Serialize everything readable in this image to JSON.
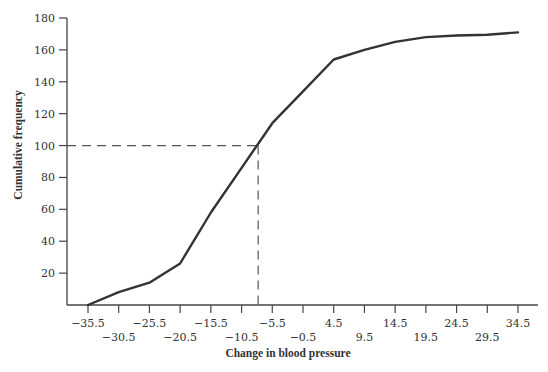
{
  "colors": {
    "background": "#ffffff",
    "axis": "#444444",
    "curve": "#333333",
    "dashed": "#555555",
    "text": "#333333"
  },
  "chart_data": {
    "type": "line",
    "title": "",
    "xlabel": "Change in blood pressure",
    "ylabel": "Cumulative frequency",
    "x": [
      -35.5,
      -30.5,
      -25.5,
      -20.5,
      -15.5,
      -10.5,
      -5.5,
      -0.5,
      4.5,
      9.5,
      14.5,
      19.5,
      24.5,
      29.5,
      34.5
    ],
    "series": [
      {
        "name": "Cumulative frequency",
        "values": [
          0,
          8,
          14,
          26,
          58,
          86,
          114,
          134,
          154,
          160,
          165,
          168,
          169,
          169.5,
          171
        ]
      }
    ],
    "xticks": [
      "−35.5",
      "−30.5",
      "−25.5",
      "−20.5",
      "−15.5",
      "−10.5",
      "−5.5",
      "−0.5",
      "4.5",
      "9.5",
      "14.5",
      "19.5",
      "24.5",
      "29.5",
      "34.5"
    ],
    "yticks": [
      "20",
      "40",
      "60",
      "80",
      "100",
      "120",
      "140",
      "160",
      "180"
    ],
    "ylim": [
      0,
      180
    ],
    "xlim": [
      -35.5,
      34.5
    ],
    "grid": false,
    "legend": null,
    "annotations": [
      {
        "type": "dashed-reference",
        "y": 100,
        "x": -7.8,
        "description": "Dashed lines from y=100 to curve and down to x-axis"
      }
    ]
  }
}
